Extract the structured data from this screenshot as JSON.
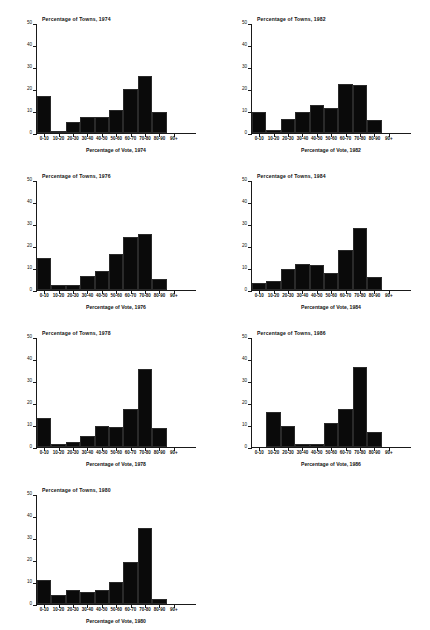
{
  "figure": {
    "panel_count": 7,
    "background_color": "#ffffff",
    "bar_color": "#0a0a0a",
    "axis_color": "#1a1a1a"
  },
  "chart_data": [
    {
      "type": "bar",
      "title": "Percentage of Towns, 1974",
      "xlabel": "Percentage of Vote, 1974",
      "ylabel": "",
      "categories": [
        "0-10",
        "10-20",
        "20-30",
        "30-40",
        "40-50",
        "50-60",
        "60-70",
        "70-80",
        "80-90",
        "90+"
      ],
      "values": [
        17,
        1,
        5,
        7.5,
        7.5,
        10.5,
        20,
        26,
        9.5,
        0
      ],
      "ylim": [
        0,
        50
      ],
      "yticks": [
        0,
        10,
        20,
        30,
        40,
        50
      ],
      "grid": false,
      "legend": "none"
    },
    {
      "type": "bar",
      "title": "Percentage of Towns, 1982",
      "xlabel": "Percentage of Vote, 1982",
      "ylabel": "",
      "categories": [
        "0-10",
        "10-20",
        "20-30",
        "30-40",
        "40-50",
        "50-60",
        "60-70",
        "70-80",
        "80-90",
        "90+"
      ],
      "values": [
        9.5,
        1.5,
        6.5,
        9.5,
        13,
        11.5,
        22.5,
        22,
        6,
        0
      ],
      "ylim": [
        0,
        50
      ],
      "yticks": [
        0,
        10,
        20,
        30,
        40,
        50
      ],
      "grid": false,
      "legend": "none"
    },
    {
      "type": "bar",
      "title": "Percentage of Towns, 1976",
      "xlabel": "Percentage of Vote, 1976",
      "ylabel": "",
      "categories": [
        "0-10",
        "10-20",
        "20-30",
        "30-40",
        "40-50",
        "50-60",
        "60-70",
        "70-80",
        "80-90",
        "90+"
      ],
      "values": [
        14.5,
        2.5,
        2.5,
        6.5,
        8.5,
        16.5,
        24.5,
        25.5,
        5,
        0
      ],
      "ylim": [
        0,
        50
      ],
      "yticks": [
        0,
        10,
        20,
        30,
        40,
        50
      ],
      "grid": false,
      "legend": "none"
    },
    {
      "type": "bar",
      "title": "Percentage of Towns, 1984",
      "xlabel": "Percentage of Vote, 1984",
      "ylabel": "",
      "categories": [
        "0-10",
        "10-20",
        "20-30",
        "30-40",
        "40-50",
        "50-60",
        "60-70",
        "70-80",
        "80-90",
        "90+"
      ],
      "values": [
        3,
        4,
        9.5,
        12,
        11.5,
        8,
        18.5,
        28.5,
        6,
        0
      ],
      "ylim": [
        0,
        50
      ],
      "yticks": [
        0,
        10,
        20,
        30,
        40,
        50
      ],
      "grid": false,
      "legend": "none"
    },
    {
      "type": "bar",
      "title": "Percentage of Towns, 1978",
      "xlabel": "Percentage of Vote, 1978",
      "ylabel": "",
      "categories": [
        "0-10",
        "10-20",
        "20-30",
        "30-40",
        "40-50",
        "50-60",
        "60-70",
        "70-80",
        "80-90",
        "90+"
      ],
      "values": [
        13.5,
        1.5,
        2.5,
        5,
        9.5,
        9,
        17.5,
        36,
        8.5,
        0
      ],
      "ylim": [
        0,
        50
      ],
      "yticks": [
        0,
        10,
        20,
        30,
        40,
        50
      ],
      "grid": false,
      "legend": "none"
    },
    {
      "type": "bar",
      "title": "Percentage of Towns, 1986",
      "xlabel": "Percentage of Vote, 1986",
      "ylabel": "",
      "categories": [
        "0-10",
        "10-20",
        "20-30",
        "30-40",
        "40-50",
        "50-60",
        "60-70",
        "70-80",
        "80-90",
        "90+"
      ],
      "values": [
        0,
        16,
        9.5,
        1.5,
        1.2,
        11,
        17.5,
        36.5,
        7,
        0
      ],
      "ylim": [
        0,
        50
      ],
      "yticks": [
        0,
        10,
        20,
        30,
        40,
        50
      ],
      "grid": false,
      "legend": "none"
    },
    {
      "type": "bar",
      "title": "Percentage of Towns, 1980",
      "xlabel": "Percentage of Vote, 1980",
      "ylabel": "",
      "categories": [
        "0-10",
        "10-20",
        "20-30",
        "30-40",
        "40-50",
        "50-60",
        "60-70",
        "70-80",
        "80-90",
        "90+"
      ],
      "values": [
        11,
        4,
        6.5,
        5.5,
        6.5,
        10,
        19.5,
        35,
        2.5,
        0
      ],
      "ylim": [
        0,
        50
      ],
      "yticks": [
        0,
        10,
        20,
        30,
        40,
        50
      ],
      "grid": false,
      "legend": "none"
    }
  ]
}
